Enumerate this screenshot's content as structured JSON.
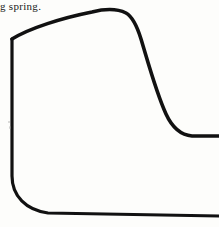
{
  "page": {
    "width": 219,
    "height": 227,
    "background_color": "#fdfdfb",
    "ink_color": "#111111"
  },
  "caption": {
    "text": "g spring.",
    "note": "partial line of body text cropped at left edge of scan"
  },
  "figure": {
    "name": "spring-profile-curve",
    "stroke_color": "#111111",
    "stroke_width_main": 3.6,
    "stroke_width_baseline": 2.2,
    "paths": {
      "upper_curve": "M 12 39 C 30 28, 62 18, 92 12 C 104 9, 116 8, 126 13 C 133 17, 137 26, 141 39 C 148 62, 156 92, 166 114 C 172 127, 180 135, 192 136 L 219 136",
      "left_edge_and_baseline": "M 12 39 L 12 176 C 12 196, 26 210, 48 213 L 219 216"
    },
    "anchor_points": {
      "upper_left_start": [
        12,
        39
      ],
      "apex": [
        115,
        9
      ],
      "shoulder": [
        138,
        33
      ],
      "tail_start": [
        192,
        136
      ],
      "tail_end": [
        219,
        136
      ],
      "left_edge_bottom": [
        12,
        176
      ],
      "baseline_left": [
        48,
        213
      ],
      "baseline_right": [
        219,
        216
      ]
    }
  },
  "specks": [
    {
      "name": "scan-speck-left",
      "x": 8,
      "y": 121,
      "size": 2
    },
    {
      "name": "scan-speck-mid",
      "x": 9,
      "y": 126,
      "size": 2
    }
  ]
}
